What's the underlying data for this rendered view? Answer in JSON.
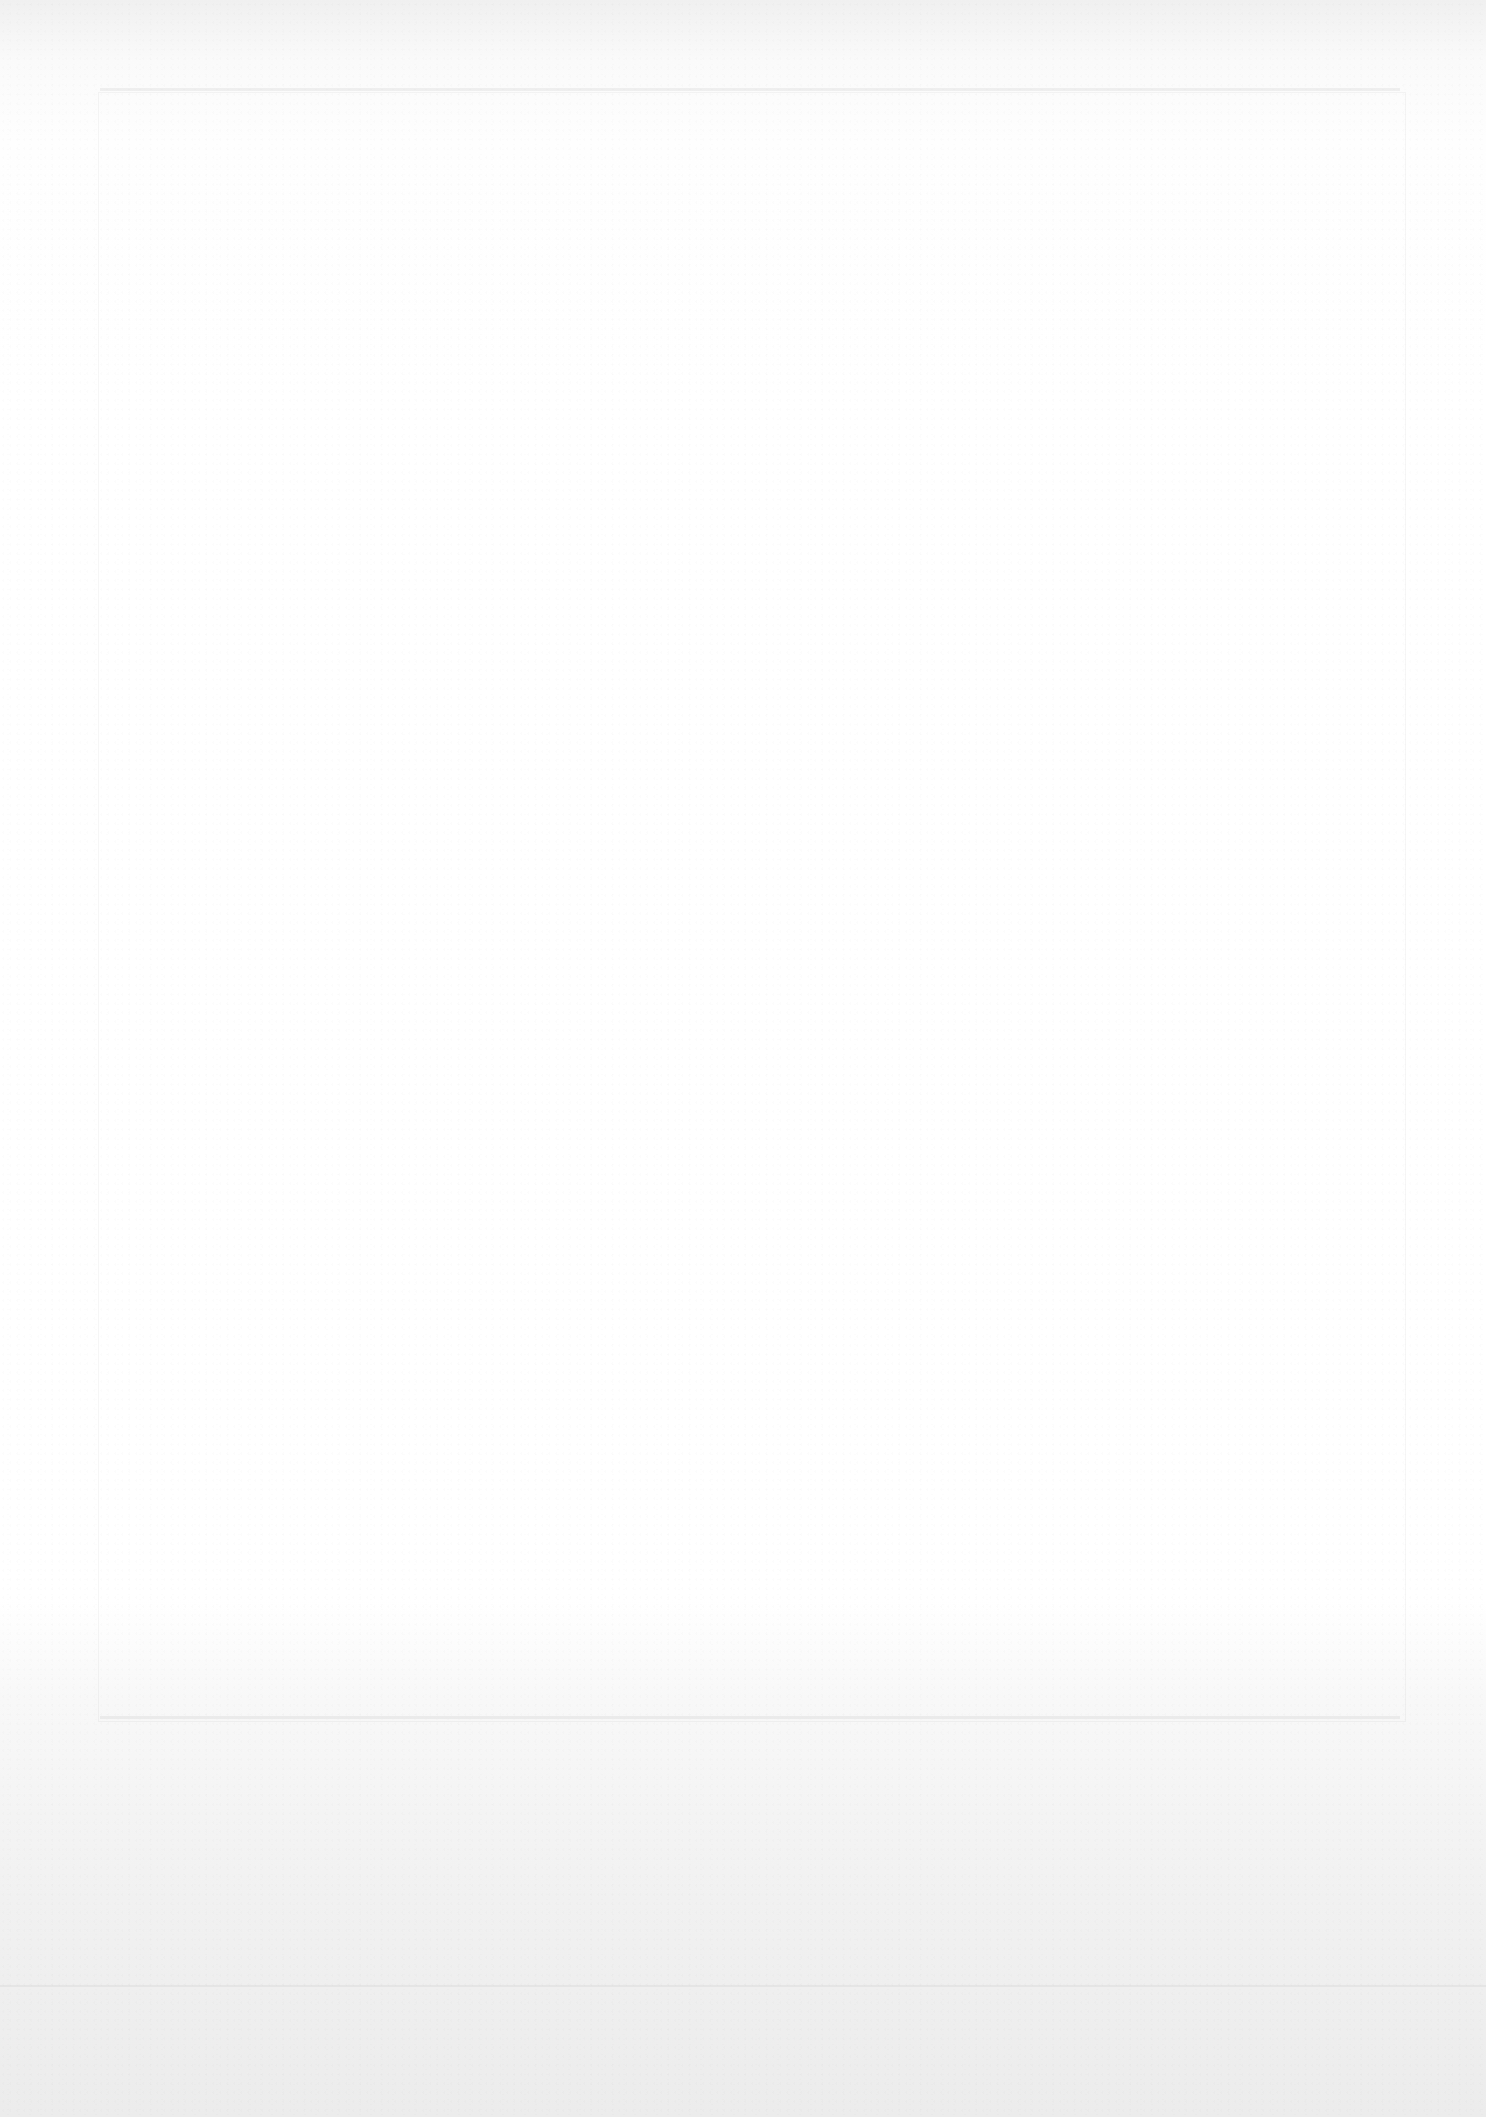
{
  "document": {
    "type": "blank-scanned-page",
    "content": []
  }
}
